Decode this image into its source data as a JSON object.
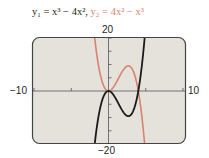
{
  "title": {
    "y1": "y₁ = x³ − 4x²,",
    "y2": "y₂ = 4x² − x³"
  },
  "axis_labels": {
    "ymax": "20",
    "ymin": "−20",
    "xmin": "−10",
    "xmax": "10"
  },
  "colors": {
    "y1": "#1a1a1a",
    "y2": "#d9826e",
    "background": "#e4e2db",
    "frame": "#444444"
  },
  "chart_data": {
    "type": "line",
    "xlabel": "",
    "ylabel": "",
    "xlim": [
      -10,
      10
    ],
    "ylim": [
      -20,
      20
    ],
    "x_ticks_every": 5,
    "y_ticks_every": 5,
    "grid": false,
    "series": [
      {
        "name": "y1 = x^3 - 4x^2",
        "color": "#1a1a1a",
        "x": [
          -2,
          -1.5,
          -1,
          -0.5,
          0,
          0.5,
          1,
          1.5,
          2,
          2.67,
          3,
          3.5,
          4,
          4.5,
          5,
          5.5
        ],
        "y": [
          -24,
          -12.4,
          -5,
          -1.1,
          0,
          -0.9,
          -3,
          -5.6,
          -8,
          -9.48,
          -9,
          -6.1,
          0,
          10.1,
          25,
          45.4
        ]
      },
      {
        "name": "y2 = 4x^2 - x^3",
        "color": "#d9826e",
        "x": [
          -2,
          -1.5,
          -1,
          -0.5,
          0,
          0.5,
          1,
          1.5,
          2,
          2.67,
          3,
          3.5,
          4,
          4.5,
          5,
          5.5
        ],
        "y": [
          24,
          12.4,
          5,
          1.1,
          0,
          0.9,
          3,
          5.6,
          8,
          9.48,
          9,
          6.1,
          0,
          -10.1,
          -25,
          -45.4
        ]
      }
    ]
  }
}
